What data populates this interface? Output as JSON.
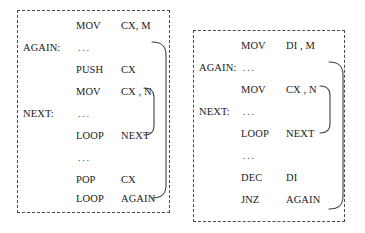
{
  "figure": {
    "panels": [
      {
        "id": "left",
        "name": "push-pop-nested-loop-listing",
        "rows": [
          {
            "label": "",
            "mnemonic": "MOV",
            "operand": "CX,  M",
            "ellipsis": ""
          },
          {
            "label": "AGAIN:",
            "mnemonic": "",
            "operand": "",
            "ellipsis": "..."
          },
          {
            "label": "",
            "mnemonic": "PUSH",
            "operand": "CX",
            "ellipsis": ""
          },
          {
            "label": "",
            "mnemonic": "MOV",
            "operand": "CX ,  N",
            "ellipsis": ""
          },
          {
            "label": "NEXT:",
            "mnemonic": "",
            "operand": "",
            "ellipsis": "..."
          },
          {
            "label": "",
            "mnemonic": "LOOP",
            "operand": "NEXT",
            "ellipsis": ""
          },
          {
            "label": "",
            "mnemonic": "",
            "operand": "",
            "ellipsis": "..."
          },
          {
            "label": "",
            "mnemonic": "POP",
            "operand": "CX",
            "ellipsis": ""
          },
          {
            "label": "",
            "mnemonic": "LOOP",
            "operand": "AGAIN",
            "ellipsis": ""
          }
        ]
      },
      {
        "id": "right",
        "name": "dec-jnz-nested-loop-listing",
        "rows": [
          {
            "label": "",
            "mnemonic": "MOV",
            "operand": "DI ,  M",
            "ellipsis": ""
          },
          {
            "label": "AGAIN:",
            "mnemonic": "",
            "operand": "",
            "ellipsis": "..."
          },
          {
            "label": "",
            "mnemonic": "MOV",
            "operand": "CX ,  N",
            "ellipsis": ""
          },
          {
            "label": "NEXT:",
            "mnemonic": "",
            "operand": "",
            "ellipsis": "..."
          },
          {
            "label": "",
            "mnemonic": "LOOP",
            "operand": "NEXT",
            "ellipsis": ""
          },
          {
            "label": "",
            "mnemonic": "",
            "operand": "",
            "ellipsis": "..."
          },
          {
            "label": "",
            "mnemonic": "DEC",
            "operand": "DI",
            "ellipsis": ""
          },
          {
            "label": "",
            "mnemonic": "JNZ",
            "operand": "AGAIN",
            "ellipsis": ""
          }
        ]
      }
    ],
    "colors": {
      "ink": "#1a1a1a",
      "border": "#4a4a4a",
      "brace": "#3c3c3c",
      "background": "#ffffff"
    }
  }
}
